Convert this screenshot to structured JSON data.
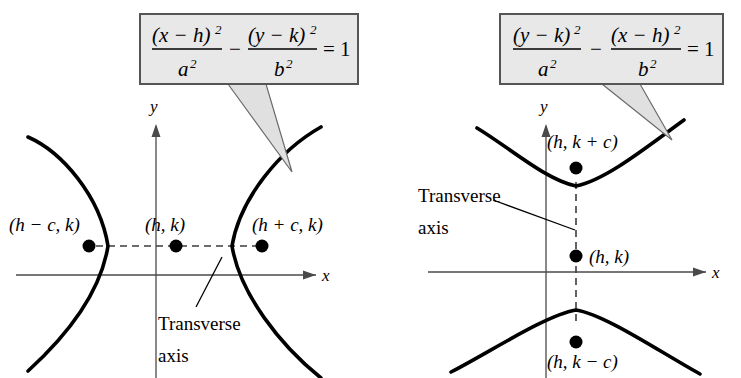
{
  "figure": {
    "background_color": "#ffffff",
    "curve_color": "#000000",
    "axis_color": "#4a4a4a",
    "callout_fill": "#e8e8e8",
    "callout_border": "#555555"
  },
  "left_panel": {
    "equation": {
      "num1": "(x − h)",
      "num1_exp": "2",
      "den1": "a",
      "den1_exp": "2",
      "operator": "−",
      "num2": "(y − k)",
      "num2_exp": "2",
      "den2": "b",
      "den2_exp": "2",
      "equals": "= 1",
      "plain": "(x − h)²/a² − (y − k)²/b² = 1"
    },
    "axes": {
      "x_label": "x",
      "y_label": "y"
    },
    "points": [
      {
        "label": "(h − c, k)",
        "name": "left-focus"
      },
      {
        "label": "(h, k)",
        "name": "center"
      },
      {
        "label": "(h + c, k)",
        "name": "right-focus"
      }
    ],
    "annotation": {
      "line1": "Transverse",
      "line2": "axis"
    }
  },
  "right_panel": {
    "equation": {
      "num1": "(y − k)",
      "num1_exp": "2",
      "den1": "a",
      "den1_exp": "2",
      "operator": "−",
      "num2": "(x − h)",
      "num2_exp": "2",
      "den2": "b",
      "den2_exp": "2",
      "equals": "= 1",
      "plain": "(y − k)²/a² − (x − h)²/b² = 1"
    },
    "axes": {
      "x_label": "x",
      "y_label": "y"
    },
    "points": [
      {
        "label": "(h, k + c)",
        "name": "upper-focus"
      },
      {
        "label": "(h, k)",
        "name": "center"
      },
      {
        "label": "(h, k − c)",
        "name": "lower-focus"
      }
    ],
    "annotation": {
      "line1": "Transverse",
      "line2": "axis"
    }
  }
}
